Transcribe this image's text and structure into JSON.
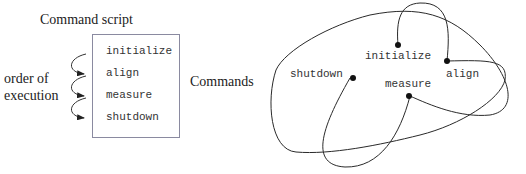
{
  "left_panel": {
    "title": "Command script",
    "order_label_line1": "order of",
    "order_label_line2": "execution",
    "commands_label": "Commands",
    "script_commands": [
      "initialize",
      "align",
      "measure",
      "shutdown"
    ]
  },
  "right_panel": {
    "nodes": [
      {
        "label": "initialize"
      },
      {
        "label": "align"
      },
      {
        "label": "shutdown"
      },
      {
        "label": "measure"
      }
    ]
  },
  "colors": {
    "line": "#2a2a2a",
    "box_border": "#8a8aa0",
    "text": "#222222"
  }
}
